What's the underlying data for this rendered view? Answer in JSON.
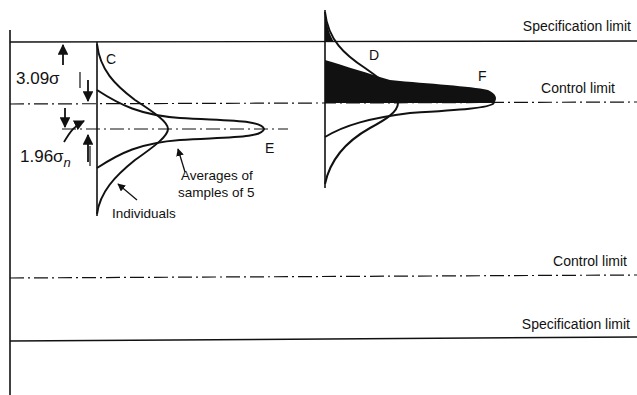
{
  "diagram": {
    "type": "control-chart-distributions",
    "lines": {
      "upper_spec": {
        "label": "Specification limit",
        "y": 42,
        "style": "solid"
      },
      "upper_control": {
        "label": "Control limit",
        "y": 103,
        "style": "dash-dot"
      },
      "center_mean": {
        "label": "",
        "y": 128,
        "style": "dash-dot"
      },
      "lower_control": {
        "label": "Control limit",
        "y": 277,
        "style": "dash-dot"
      },
      "lower_spec": {
        "label": "Specification limit",
        "y": 340,
        "style": "solid"
      }
    },
    "dimensions": {
      "upper": "3.09σ",
      "lower_main": "1.96σ",
      "lower_sub": "n"
    },
    "curve_labels": {
      "C": "C",
      "D": "D",
      "E": "E",
      "F": "F"
    },
    "annotations": {
      "averages_line1": "Averages of",
      "averages_line2": "samples of 5",
      "individuals": "Individuals"
    },
    "colors": {
      "ink": "#111111",
      "background": "#ffffff"
    }
  }
}
